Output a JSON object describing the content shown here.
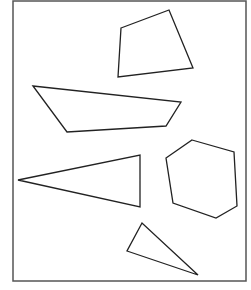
{
  "diagram": {
    "frame": {
      "x": 13,
      "y": 1,
      "width": 233,
      "height": 280,
      "stroke": "#555555",
      "stroke_width": 1.5
    },
    "stroke_color": "#222222",
    "shapes": [
      {
        "name": "quadrilateral-top",
        "type": "quadrilateral",
        "points": "121,28 169,10 193,68 118,77"
      },
      {
        "name": "trapezoid-middle",
        "type": "quadrilateral",
        "points": "33,86 181,102 166,126 67,132"
      },
      {
        "name": "triangle-left",
        "type": "triangle",
        "points": "18,180 140,155 140,207"
      },
      {
        "name": "hexagon-right",
        "type": "hexagon",
        "points": "192,140 234,152 237,206 216,218 173,203 166,158"
      },
      {
        "name": "triangle-bottom",
        "type": "triangle",
        "points": "142,223 127,251 198,275"
      }
    ]
  }
}
